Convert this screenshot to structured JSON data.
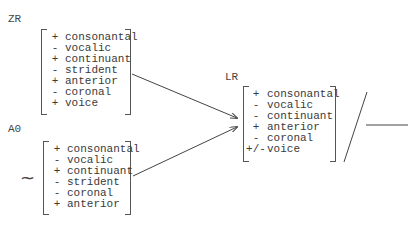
{
  "zr": {
    "label": "ZR",
    "features": [
      {
        "sign": "+",
        "name": "consonantal"
      },
      {
        "sign": "-",
        "name": "vocalic"
      },
      {
        "sign": "+",
        "name": "continuant"
      },
      {
        "sign": "-",
        "name": "strident"
      },
      {
        "sign": "+",
        "name": "anterior"
      },
      {
        "sign": "-",
        "name": "coronal"
      },
      {
        "sign": "+",
        "name": "voice"
      }
    ]
  },
  "a0": {
    "label": "A0",
    "prefix_symbol": "~",
    "features": [
      {
        "sign": "+",
        "name": "consonantal"
      },
      {
        "sign": "-",
        "name": "vocalic"
      },
      {
        "sign": "+",
        "name": "continuant"
      },
      {
        "sign": "-",
        "name": "strident"
      },
      {
        "sign": "-",
        "name": "coronal"
      },
      {
        "sign": "+",
        "name": "anterior"
      }
    ]
  },
  "lr": {
    "label": "LR",
    "features": [
      {
        "sign": "+",
        "name": "consonantal"
      },
      {
        "sign": "-",
        "name": "vocalic"
      },
      {
        "sign": "-",
        "name": "continuant"
      },
      {
        "sign": "+",
        "name": "anterior"
      },
      {
        "sign": "-",
        "name": "coronal"
      },
      {
        "sign": "+/-",
        "name": "voice"
      }
    ]
  },
  "environment": {
    "slash": "/",
    "blank": "___"
  }
}
